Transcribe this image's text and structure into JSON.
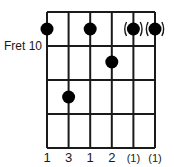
{
  "diagram": {
    "type": "guitar-chord-diagram",
    "fret_label": "Fret 10",
    "strings": 6,
    "frets_shown": 4,
    "dots": [
      {
        "string": 1,
        "fret": 0,
        "optional": false
      },
      {
        "string": 3,
        "fret": 0,
        "optional": false
      },
      {
        "string": 5,
        "fret": 0,
        "optional": true
      },
      {
        "string": 6,
        "fret": 0,
        "optional": true
      },
      {
        "string": 4,
        "fret": 1,
        "optional": false
      },
      {
        "string": 2,
        "fret": 2,
        "optional": false
      }
    ],
    "fingering": [
      "1",
      "3",
      "1",
      "2",
      "(1)",
      "(1)"
    ],
    "colors": {
      "line": "#1a1a1a",
      "dot": "#000000",
      "background": "#ffffff"
    }
  }
}
